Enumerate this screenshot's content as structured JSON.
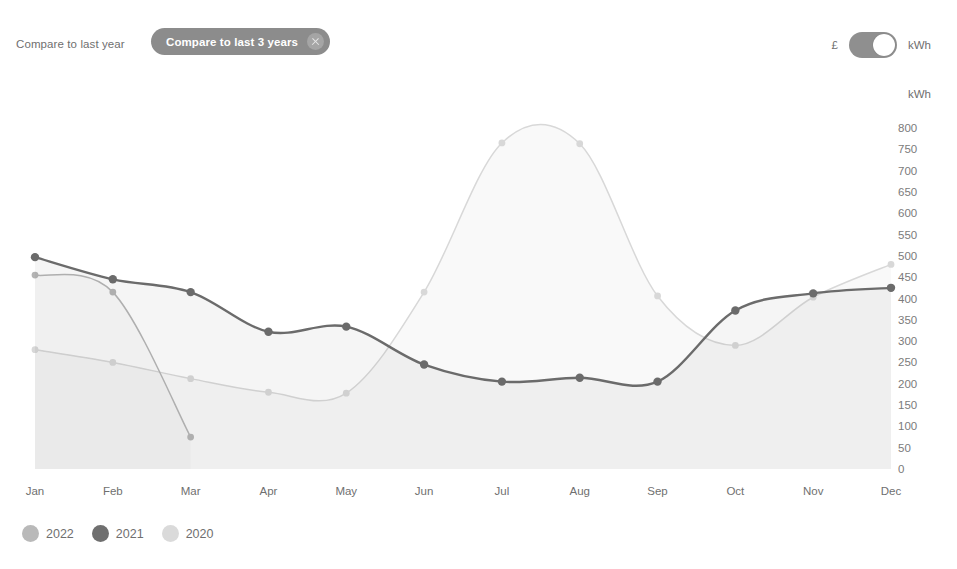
{
  "controls": {
    "compare_last_year_label": "Compare to last year",
    "compare_last_3_years_label": "Compare to last 3 years",
    "close_icon": "close-circle-icon",
    "unit_left_label": "£",
    "unit_right_label": "kWh",
    "toggle_state": "kWh",
    "toggle_track_color": "#8f8f8f",
    "pill_color": "#8c8c8c"
  },
  "chart_data": {
    "type": "line",
    "title": "",
    "xlabel": "",
    "ylabel": "kWh",
    "axis_unit": "kWh",
    "categories": [
      "Jan",
      "Feb",
      "Mar",
      "Apr",
      "May",
      "Jun",
      "Jul",
      "Aug",
      "Sep",
      "Oct",
      "Nov",
      "Dec"
    ],
    "ylim": [
      0,
      800
    ],
    "ytick_step": 50,
    "yticks": [
      800,
      750,
      700,
      650,
      600,
      550,
      500,
      450,
      400,
      350,
      300,
      250,
      200,
      150,
      100,
      50,
      0
    ],
    "grid": false,
    "legend_position": "bottom-left",
    "series": [
      {
        "name": "2022",
        "color": "#b4b4b4",
        "values": [
          455,
          415,
          75,
          null,
          null,
          null,
          null,
          null,
          null,
          null,
          null,
          null
        ]
      },
      {
        "name": "2021",
        "color": "#6b6b6b",
        "values": [
          497,
          445,
          415,
          322,
          334,
          245,
          205,
          214,
          205,
          372,
          412,
          425
        ]
      },
      {
        "name": "2020",
        "color": "#d8d8d8",
        "values": [
          280,
          250,
          212,
          180,
          178,
          415,
          765,
          763,
          406,
          290,
          403,
          480
        ]
      }
    ]
  },
  "legend": {
    "items": [
      {
        "label": "2022",
        "color": "#b9b9b9"
      },
      {
        "label": "2021",
        "color": "#6f6f6f"
      },
      {
        "label": "2020",
        "color": "#dadada"
      }
    ]
  }
}
